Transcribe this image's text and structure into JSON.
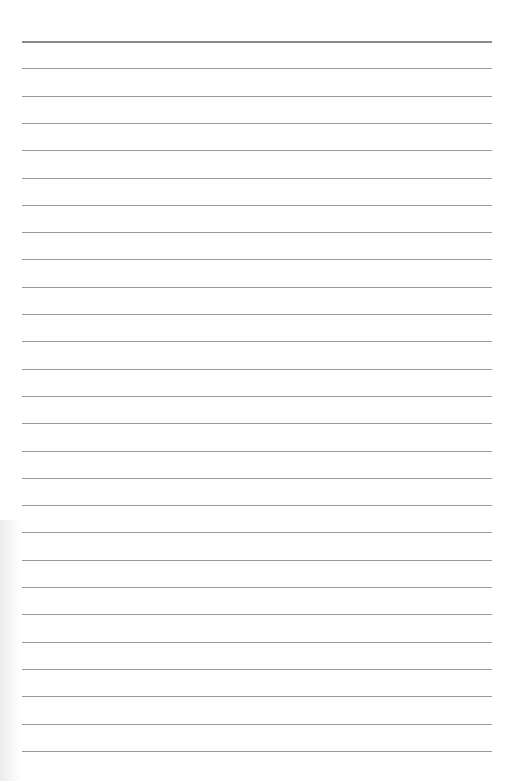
{
  "paper": {
    "type": "lined-notebook-page",
    "background": "#ffffff",
    "line_color": "#9a9a9a",
    "header_line_color": "#8a8a8a",
    "line_count": 27,
    "first_line_y": 41,
    "line_spacing": 27.3,
    "line_left": 22,
    "line_right": 492
  }
}
